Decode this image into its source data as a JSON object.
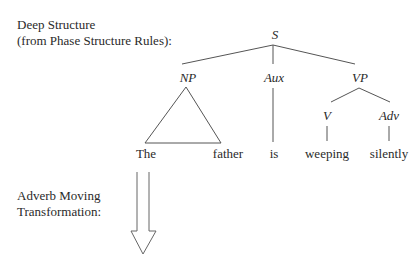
{
  "headings": {
    "deep_structure_line1": "Deep Structure",
    "deep_structure_line2": "(from Phase Structure Rules):",
    "transformation_line1": "Adverb Moving",
    "transformation_line2": "Transformation:"
  },
  "tree": {
    "nodes": {
      "S": "S",
      "NP": "NP",
      "Aux": "Aux",
      "VP": "VP",
      "V": "V",
      "Adv": "Adv"
    },
    "words": {
      "the": "The",
      "father": "father",
      "is": "is",
      "weeping": "weeping",
      "silently": "silently"
    }
  },
  "arrow": {
    "direction": "down",
    "meaning": "transformation-arrow"
  },
  "colors": {
    "line": "#555555",
    "text": "#2a2a2a",
    "background": "#ffffff"
  }
}
